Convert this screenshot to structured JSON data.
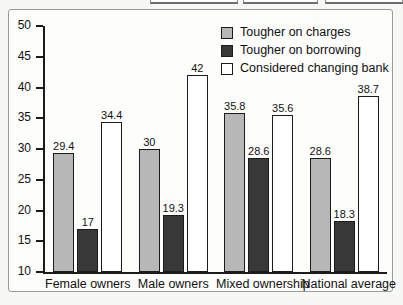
{
  "top_strip": {
    "boxes": [
      {
        "name": "toolbar-box-1"
      },
      {
        "name": "toolbar-box-2"
      },
      {
        "name": "toolbar-box-3"
      }
    ]
  },
  "colors": {
    "series_tougher_on_charges": "#b7b7b7",
    "series_tougher_on_borrowing": "#383838",
    "series_considered_changing_bank": "#ffffff",
    "axis": "#1b1b1b",
    "frame": "#9a9a9a",
    "page_background": "#f7f7f5"
  },
  "chart_data": {
    "type": "bar",
    "title": "",
    "subtitle": "",
    "xlabel": "",
    "ylabel": "",
    "ylim": [
      10,
      50
    ],
    "yticks": [
      10,
      15,
      20,
      25,
      30,
      35,
      40,
      45,
      50
    ],
    "ytick_labels": [
      "10",
      "15",
      "20",
      "25",
      "30",
      "35",
      "40",
      "45",
      "50"
    ],
    "grid": false,
    "legend_position": "top-right",
    "categories": [
      "Female owners",
      "Male owners",
      "Mixed ownership",
      "National average"
    ],
    "series": [
      {
        "name": "Tougher on charges",
        "values": [
          29.4,
          30,
          35.8,
          28.6
        ],
        "labels": [
          "29.4",
          "30",
          "35.8",
          "28.6"
        ],
        "color": "#b7b7b7"
      },
      {
        "name": "Tougher on borrowing",
        "values": [
          17,
          19.3,
          28.6,
          18.3
        ],
        "labels": [
          "17",
          "19.3",
          "28.6",
          "18.3"
        ],
        "color": "#383838"
      },
      {
        "name": "Considered changing bank",
        "values": [
          34.4,
          42,
          35.6,
          38.7
        ],
        "labels": [
          "34.4",
          "42",
          "35.6",
          "38.7"
        ],
        "color": "#ffffff"
      }
    ]
  }
}
